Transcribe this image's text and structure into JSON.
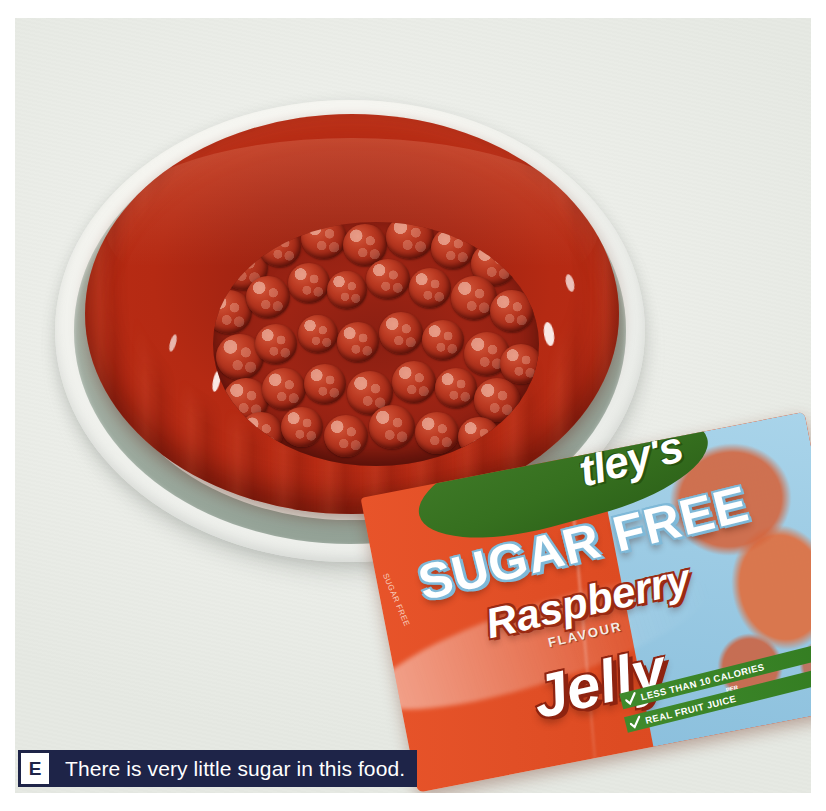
{
  "photo": {
    "alt_description": "A raspberry ring jelly turned out onto a grey-green rimmed plate, the centre filled with whole raspberries, with an opened packet of Hartley's Sugar Free Raspberry Flavour Jelly lying in front of it.",
    "background_color": "#eef1ec",
    "plate": {
      "rim_color": "#a7b4a8",
      "inner_color": "#eceee9",
      "well_color": "#a3b1a5"
    },
    "jelly": {
      "color": "#a62512",
      "highlight_color": "#fff8f6",
      "shape": "ring mould"
    },
    "raspberries": {
      "color": "#9c2615",
      "count_visible": 46
    }
  },
  "packet": {
    "brand": "tley's",
    "line_sugar_free": "SUGAR FREE",
    "line_flavour_name": "Raspberry",
    "line_flavour_word": "FLAVOUR",
    "line_product": "Jelly",
    "flash_1": "LESS THAN 10 CALORIES",
    "flash_1_sub": "PER",
    "flash_2": "REAL FRUIT JUICE",
    "side_text": "SUGAR FREE",
    "colors": {
      "body": "#e14f26",
      "panel": "#9ccbe4",
      "banner": "#36701f",
      "flash": "#3f8a2c"
    }
  },
  "caption": {
    "letter": "E",
    "text": "There is very little sugar in this food.",
    "background_color": "#1e2448",
    "text_color": "#ffffff",
    "letter_box_color": "#ffffff"
  }
}
